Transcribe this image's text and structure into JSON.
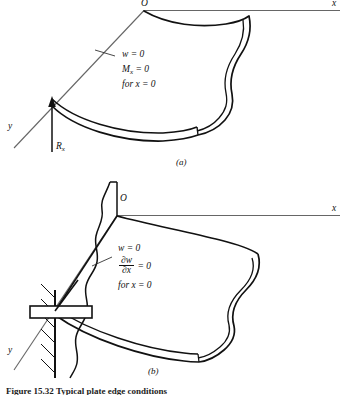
{
  "figure": {
    "caption": "Figure 15.32  Typical plate edge conditions",
    "panels": [
      {
        "key": "a",
        "caption": "(a)",
        "condition_name": "simply-supported-edge",
        "axes": {
          "origin": "O",
          "x_label": "x",
          "y_label": "y"
        },
        "reaction_label": "R",
        "reaction_subscript": "x",
        "conditions": [
          {
            "lhs": "w",
            "rel": "=",
            "rhs": "0"
          },
          {
            "lhs": "M",
            "sub": "x",
            "rel": "=",
            "rhs": "0"
          }
        ],
        "for_clause": "for  x = 0"
      },
      {
        "key": "b",
        "caption": "(b)",
        "condition_name": "clamped-fixed-edge",
        "axes": {
          "origin": "O",
          "x_label": "x",
          "y_label": "y"
        },
        "conditions": [
          {
            "lhs": "w",
            "rel": "=",
            "rhs": "0"
          },
          {
            "numerator": "∂w",
            "denominator": "∂x",
            "rel": "=",
            "rhs": "0"
          }
        ],
        "for_clause": "for  x = 0"
      }
    ]
  },
  "colors": {
    "ink": "#111111",
    "axis": "#555555",
    "paper": "#ffffff"
  }
}
